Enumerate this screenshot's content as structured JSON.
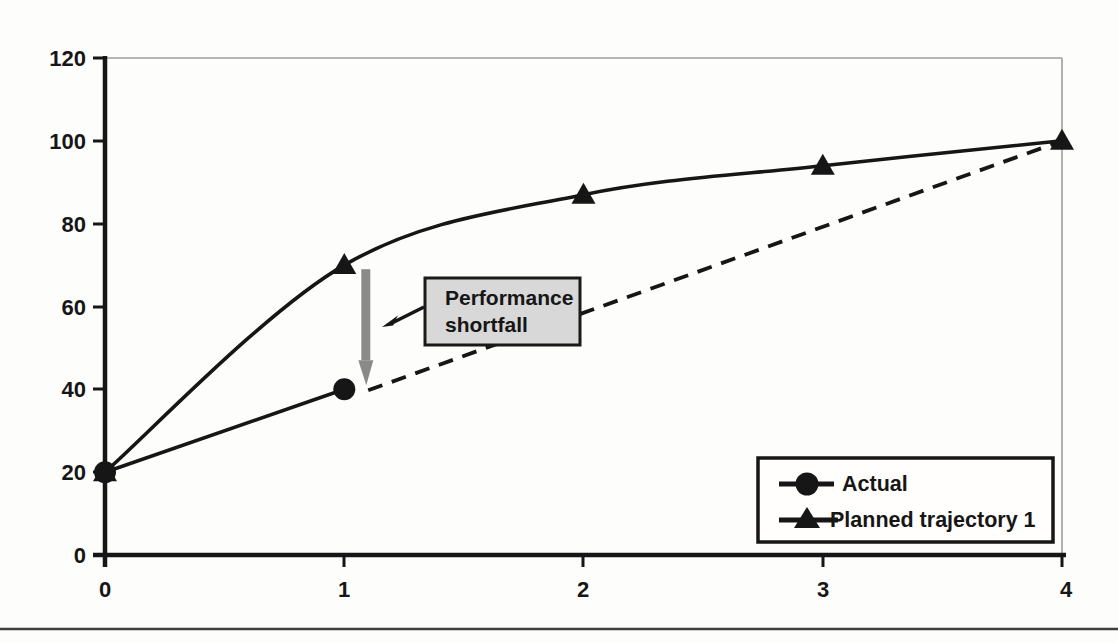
{
  "figure": {
    "background": "#fdfdfb",
    "bottom_rule_color": "#3f3f3f"
  },
  "chart_data": {
    "type": "line",
    "title": "",
    "xlabel": "",
    "ylabel": "",
    "xlim": [
      0,
      4
    ],
    "ylim": [
      0,
      120
    ],
    "grid": false,
    "x_ticks": [
      "0",
      "1",
      "2",
      "3",
      "4"
    ],
    "y_ticks": [
      "0",
      "20",
      "40",
      "60",
      "80",
      "100",
      "120"
    ],
    "series": [
      {
        "name": "Actual",
        "marker": "circle",
        "line_style": "solid",
        "smooth": false,
        "color": "#161616",
        "x": [
          0,
          1
        ],
        "values": [
          20,
          40
        ]
      },
      {
        "name": "Planned trajectory 1",
        "marker": "triangle",
        "line_style": "solid",
        "smooth": true,
        "color": "#161616",
        "x": [
          0,
          1,
          2,
          3,
          4
        ],
        "values": [
          20,
          70,
          87,
          94,
          100
        ]
      }
    ],
    "projection_line": {
      "line_style": "dashed",
      "color": "#161616",
      "from": {
        "x": 1.1,
        "y": 40
      },
      "to": {
        "x": 4,
        "y": 100
      }
    },
    "shortfall_arrow": {
      "at_x": 1.09,
      "from_y": 69,
      "to_y": 41,
      "color": "#8a8a8a"
    },
    "annotation": {
      "line1": "Performance",
      "line2": "shortfall",
      "box_fill": "#d8d8d8",
      "box_border": "#1a1a1a"
    },
    "legend": {
      "position": "bottom-right",
      "entries": [
        {
          "label": "Actual",
          "marker": "circle"
        },
        {
          "label": "Planned trajectory 1",
          "marker": "triangle"
        }
      ]
    }
  }
}
